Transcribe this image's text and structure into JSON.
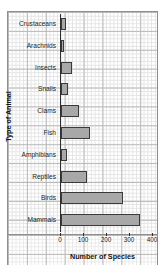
{
  "chart_data": {
    "type": "bar",
    "orientation": "horizontal",
    "title": "",
    "xlabel": "Number of Species",
    "ylabel": "Type of Animal",
    "xlim": [
      0,
      400
    ],
    "xticks": [
      0,
      100,
      200,
      300,
      400
    ],
    "xtick_labels": [
      "0",
      "100",
      "200",
      "300",
      "400"
    ],
    "grid": true,
    "legend": "none",
    "categories": [
      "Crustaceans",
      "Arachnids",
      "Insects",
      "Snails",
      "Clams",
      "Fish",
      "Amphibians",
      "Reptiles",
      "Birds",
      "Mammals"
    ],
    "values": [
      22,
      12,
      48,
      32,
      80,
      125,
      25,
      115,
      270,
      345
    ],
    "bar_fill": "#a8a8a8",
    "bar_border": "#3a3a3a"
  }
}
